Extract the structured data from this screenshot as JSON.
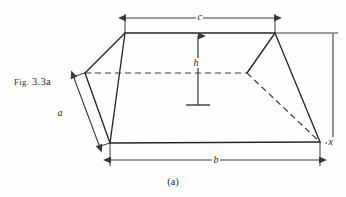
{
  "figure": {
    "label_prefix": "Fig.",
    "label_number": "3.3a",
    "caption": "(a)",
    "colors": {
      "stroke": "#262626",
      "dimension": "#3a3a3a",
      "background": "#fefefe"
    }
  },
  "dimensions": {
    "top_width": {
      "name": "c",
      "label": "c",
      "orientation": "horizontal",
      "position": "top"
    },
    "bottom_width": {
      "name": "b",
      "label": "b",
      "orientation": "horizontal",
      "position": "bottom"
    },
    "slant_depth": {
      "name": "a",
      "label": "a",
      "orientation": "oblique",
      "position": "left"
    },
    "height": {
      "name": "h",
      "label": "h",
      "orientation": "vertical",
      "position": "center"
    },
    "right_height": {
      "name": "x",
      "label": "x",
      "orientation": "vertical",
      "position": "right"
    }
  },
  "shape": {
    "type": "truncated-pyramid-frustum",
    "vertices": {
      "top_left": [
        125,
        33
      ],
      "top_right": [
        275,
        33
      ],
      "bottom_left": [
        110,
        143
      ],
      "bottom_right": [
        320,
        142
      ],
      "back_left": [
        85,
        73
      ],
      "back_right": [
        247,
        73
      ]
    }
  }
}
